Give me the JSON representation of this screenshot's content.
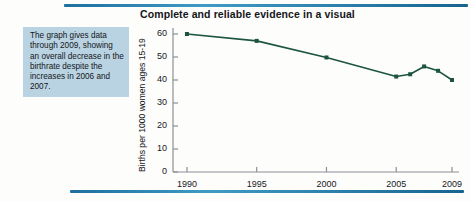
{
  "decor": {
    "top_rule": "top-rule",
    "bottom_rule": "bottom-rule",
    "accent_color": "#2a7ea9"
  },
  "callout": {
    "text": "The graph gives data through 2009, showing an overall decrease in the birthrate despite the increases in 2006 and 2007.",
    "background": "#b9d3e2"
  },
  "chart_data": {
    "type": "line",
    "title": "Complete and reliable evidence in a visual",
    "xlabel": "",
    "ylabel": "Births per 1000 women ages 15-19",
    "x": [
      1990,
      1995,
      2000,
      2005,
      2006,
      2007,
      2008,
      2009
    ],
    "values": [
      60.0,
      57.0,
      49.8,
      41.5,
      42.5,
      45.9,
      44.0,
      40.0
    ],
    "categories": [
      "1990",
      "1995",
      "2000",
      "2005",
      "2006",
      "2007",
      "2008",
      "2009"
    ],
    "xtick_labels": [
      "1990",
      "1995",
      "2000",
      "2005",
      "2009"
    ],
    "xticks": [
      1990,
      1995,
      2000,
      2005,
      2009
    ],
    "ytick_labels": [
      "0",
      "10",
      "20",
      "30",
      "40",
      "50",
      "60"
    ],
    "yticks": [
      0,
      10,
      20,
      30,
      40,
      50,
      60
    ],
    "xlim": [
      1989,
      2009.5
    ],
    "ylim": [
      0,
      62
    ],
    "grid": false,
    "legend": false,
    "series_color": "#1d5440",
    "marker": "square",
    "axis_color": "#8d8f92"
  }
}
